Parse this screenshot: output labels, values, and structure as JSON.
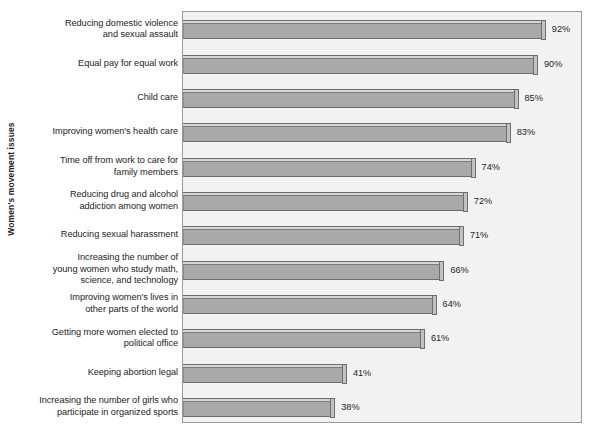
{
  "chart_data": {
    "type": "bar",
    "orientation": "horizontal",
    "title": "",
    "xlabel": "",
    "ylabel": "Women's movement issues",
    "xlim": [
      0,
      100
    ],
    "grid": false,
    "legend": null,
    "value_suffix": "%",
    "categories": [
      "Reducing domestic violence and sexual assault",
      "Equal pay for equal work",
      "Child care",
      "Improving women's health care",
      "Time off from work to care for family members",
      "Reducing drug and alcohol addiction among women",
      "Reducing sexual harassment",
      "Increasing the number of young women who study math, science, and technology",
      "Improving women's lives in other parts of the world",
      "Getting more women elected to political office",
      "Keeping abortion legal",
      "Increasing the number of girls who participate in organized sports"
    ],
    "category_lines": [
      [
        "Reducing domestic violence",
        "and sexual assault"
      ],
      [
        "Equal pay for equal work"
      ],
      [
        "Child care"
      ],
      [
        "Improving women's health care"
      ],
      [
        "Time off from work to care for",
        "family members"
      ],
      [
        "Reducing drug and alcohol",
        "addiction among women"
      ],
      [
        "Reducing sexual harassment"
      ],
      [
        "Increasing the number of",
        "young women who study math,",
        "science, and technology"
      ],
      [
        "Improving women's lives in",
        "other parts of the world"
      ],
      [
        "Getting more women elected to",
        "political office"
      ],
      [
        "Keeping abortion legal"
      ],
      [
        "Increasing the number of girls who",
        "participate in organized sports"
      ]
    ],
    "values": [
      92,
      90,
      85,
      83,
      74,
      72,
      71,
      66,
      64,
      61,
      41,
      38
    ],
    "value_labels": [
      "92%",
      "90%",
      "85%",
      "83%",
      "74%",
      "72%",
      "71%",
      "66%",
      "64%",
      "61%",
      "41%",
      "38%"
    ]
  },
  "style": {
    "plot_background": "#f2f2f2",
    "plot_border": "#9a9a9a",
    "bar_fill": "#a9a9a9",
    "bar_top": "#d6d6d6",
    "bar_cap": "#c2c2c2",
    "bar_outline": "#6e6e6e",
    "text_color": "#1d1d1d"
  }
}
